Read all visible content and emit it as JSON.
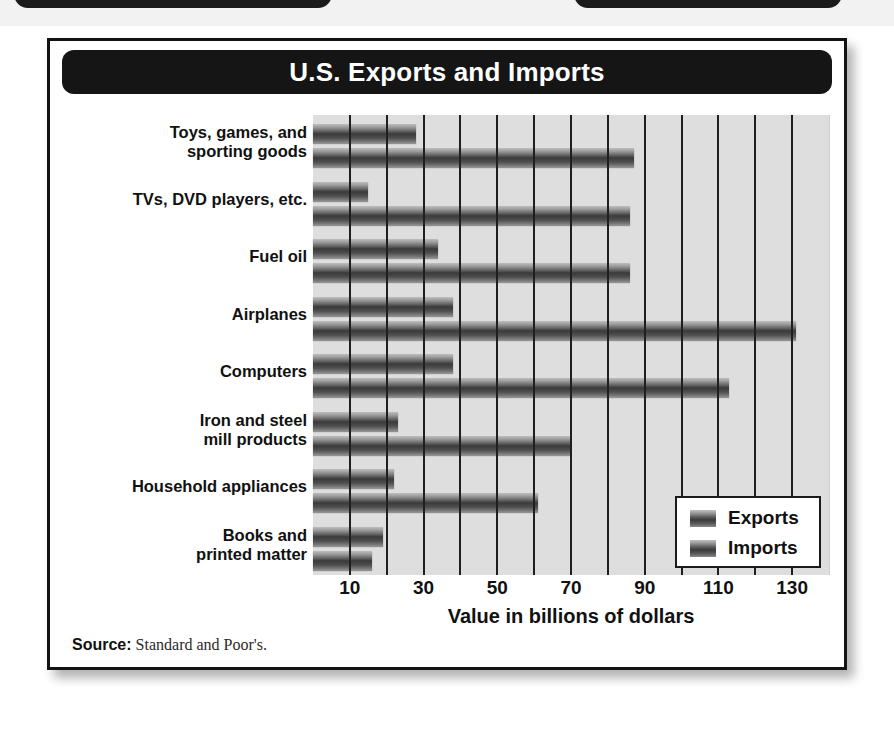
{
  "header": {
    "title": "U.S. Exports and Imports"
  },
  "footer": {
    "source_label": "Source:",
    "source_value": "Standard and Poor's."
  },
  "legend": {
    "entries": [
      {
        "label": "Exports",
        "icon": "bar-swatch-icon"
      },
      {
        "label": "Imports",
        "icon": "bar-swatch-icon"
      }
    ]
  },
  "chart_data": {
    "type": "bar",
    "orientation": "horizontal",
    "title": "U.S. Exports and Imports",
    "xlabel": "Value in billions of dollars",
    "ylabel": "",
    "xlim": [
      0,
      140
    ],
    "xticks": [
      10,
      30,
      50,
      70,
      90,
      110,
      130
    ],
    "xtick_labels": [
      "10",
      "30",
      "50",
      "70",
      "90",
      "110",
      "130"
    ],
    "gridlines_every": 10,
    "grid": true,
    "legend_position": "bottom-right",
    "categories": [
      "Toys, games, and sporting goods",
      "TVs, DVD players, etc.",
      "Fuel oil",
      "Airplanes",
      "Computers",
      "Iron and steel mill products",
      "Household appliances",
      "Books and printed matter"
    ],
    "category_lines": [
      [
        "Toys, games, and",
        "sporting goods"
      ],
      [
        "TVs, DVD players, etc."
      ],
      [
        "Fuel oil"
      ],
      [
        "Airplanes"
      ],
      [
        "Computers"
      ],
      [
        "Iron and steel",
        "mill products"
      ],
      [
        "Household appliances"
      ],
      [
        "Books and",
        "printed matter"
      ]
    ],
    "series": [
      {
        "name": "Exports",
        "values": [
          28,
          15,
          34,
          38,
          38,
          23,
          22,
          19
        ]
      },
      {
        "name": "Imports",
        "values": [
          87,
          86,
          86,
          131,
          113,
          70,
          61,
          16
        ]
      }
    ]
  }
}
